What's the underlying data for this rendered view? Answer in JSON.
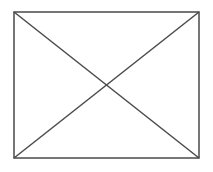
{
  "document": {
    "title": "Broken Image Placeholder",
    "kind": "missing-image-placeholder",
    "description": "Rectangular frame crossed by two full diagonals forming an X"
  },
  "canvas": {
    "width": 213,
    "height": 172,
    "background_color": "#ffffff"
  },
  "placeholder": {
    "stroke_color": "#4a4a4a",
    "stroke_width": 1.5,
    "fill_color": "none",
    "caption": "",
    "alt_text": "",
    "frame": {
      "x": 14,
      "y": 12,
      "width": 185,
      "height": 146,
      "left": 14,
      "top": 12,
      "right": 199,
      "bottom": 158
    },
    "diagonals": [
      {
        "name": "diagonal-top-left-to-bottom-right",
        "x1": 14,
        "y1": 12,
        "x2": 199,
        "y2": 158
      },
      {
        "name": "diagonal-bottom-left-to-top-right",
        "x1": 14,
        "y1": 158,
        "x2": 199,
        "y2": 12
      }
    ],
    "center": {
      "x": 106.5,
      "y": 85
    }
  }
}
